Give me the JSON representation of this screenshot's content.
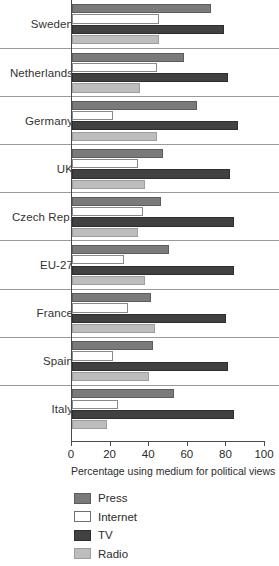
{
  "chart_data": {
    "type": "bar",
    "orientation": "horizontal",
    "title": "",
    "xlabel": "Percentage using medium for political views",
    "ylabel": "",
    "xlim": [
      0,
      100
    ],
    "xticks": [
      0,
      20,
      40,
      60,
      80,
      100
    ],
    "xtick_labels": [
      "0",
      "20",
      "40",
      "60",
      "80",
      "100"
    ],
    "grid": false,
    "legend_position": "bottom-left",
    "categories": [
      "Sweden",
      "Netherlands",
      "Germany",
      "UK",
      "Czech Rep.",
      "EU-27",
      "France",
      "Spain",
      "Italy"
    ],
    "series": [
      {
        "name": "Press",
        "color": "#7a7a7a",
        "values": [
          72,
          58,
          65,
          47,
          46,
          50,
          41,
          42,
          53
        ]
      },
      {
        "name": "Internet",
        "color": "#ffffff",
        "values": [
          45,
          44,
          21,
          34,
          37,
          27,
          29,
          21,
          24
        ]
      },
      {
        "name": "TV",
        "color": "#414141",
        "values": [
          79,
          81,
          86,
          82,
          84,
          84,
          80,
          81,
          84
        ]
      },
      {
        "name": "Radio",
        "color": "#bdbdbd",
        "values": [
          45,
          35,
          44,
          38,
          34,
          38,
          43,
          40,
          18
        ]
      }
    ]
  },
  "legend": {
    "items": [
      {
        "label": "Press"
      },
      {
        "label": "Internet"
      },
      {
        "label": "TV"
      },
      {
        "label": "Radio"
      }
    ]
  }
}
